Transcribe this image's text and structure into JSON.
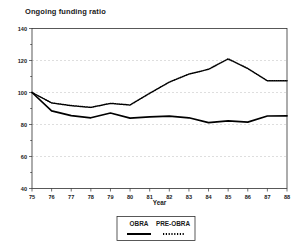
{
  "chart_data": {
    "type": "line",
    "title": "Ongoing funding ratio",
    "xlabel": "Year",
    "ylabel": "",
    "xlim": [
      75,
      88
    ],
    "ylim": [
      40,
      140
    ],
    "grid": true,
    "grid_values": [
      60,
      80,
      100,
      120
    ],
    "legend_position": "below-center",
    "x": [
      75,
      76,
      77,
      78,
      79,
      80,
      81,
      82,
      83,
      84,
      85,
      86,
      87,
      88
    ],
    "xtick_labels": [
      "75",
      "76",
      "77",
      "78",
      "79",
      "80",
      "81",
      "82",
      "83",
      "84",
      "85",
      "86",
      "87",
      "88"
    ],
    "ytick_labels": [
      "40",
      "60",
      "80",
      "100",
      "120",
      "140"
    ],
    "ytick_values": [
      40,
      60,
      80,
      100,
      120,
      140
    ],
    "series": [
      {
        "name": "OBRA",
        "style": "solid",
        "values": [
          100,
          88.5,
          85.5,
          84.2,
          87.2,
          84,
          84.8,
          85.2,
          84.2,
          81.2,
          82.3,
          81.5,
          85.3,
          85.4
        ]
      },
      {
        "name": "PRE-OBRA",
        "style": "dotted",
        "values": [
          100,
          93.5,
          91.8,
          90.7,
          93.2,
          92.2,
          99.5,
          106.5,
          111.5,
          114.5,
          121,
          115,
          107.3,
          107.3
        ]
      }
    ]
  },
  "legend": {
    "entries": [
      {
        "label": "OBRA",
        "style": "solid"
      },
      {
        "label": "PRE-OBRA",
        "style": "dotted"
      }
    ]
  }
}
